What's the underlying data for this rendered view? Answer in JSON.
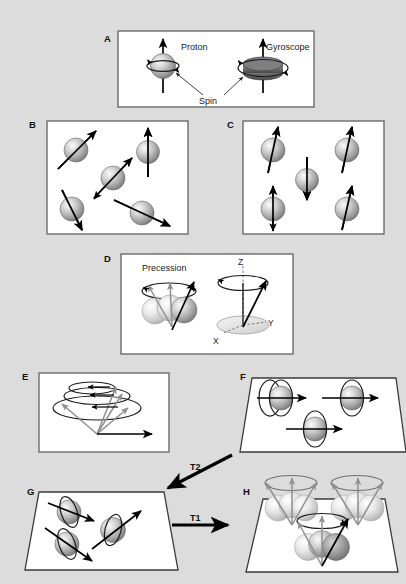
{
  "figure": {
    "background_color": "#dcdcdc",
    "panel_fill": "#ffffff",
    "panel_stroke": "#6b6b6b",
    "width": 406,
    "height": 584
  },
  "panels": [
    {
      "id": "A",
      "label": "A",
      "caption": "Proton spin compared to a spinning gyroscope",
      "texts": {
        "proton": "Proton",
        "gyroscope": "Gyroscope",
        "spin": "Spin"
      }
    },
    {
      "id": "B",
      "label": "B",
      "caption": "Randomly oriented proton spins with no external magnetic field",
      "spin_count": 5,
      "spin_angles_deg": [
        -50,
        -90,
        -40,
        -115,
        -25
      ]
    },
    {
      "id": "C",
      "label": "C",
      "caption": "Spins aligned parallel and antiparallel in an external magnetic field",
      "spin_count": 5,
      "spin_directions": [
        "up",
        "up",
        "down",
        "up",
        "up"
      ]
    },
    {
      "id": "D",
      "label": "D",
      "caption": "Precession of the magnetic moment about the main field axis",
      "texts": {
        "precession": "Precession",
        "axis_z": "Z",
        "axis_y": "Y",
        "axis_x": "X"
      }
    },
    {
      "id": "E",
      "label": "E",
      "caption": "Net magnetization vector spiralling down into the transverse plane"
    },
    {
      "id": "F",
      "label": "F",
      "caption": "Spins precessing in phase within the transverse plane"
    },
    {
      "id": "G",
      "label": "G",
      "caption": "Spins dephasing in the transverse plane"
    },
    {
      "id": "H",
      "label": "H",
      "caption": "Longitudinal recovery of magnetization along the main field"
    }
  ],
  "relaxation_arrows": [
    {
      "id": "T2",
      "label": "T2",
      "from_panel": "F",
      "to_panel": "G",
      "direction": "diagonal-down-left"
    },
    {
      "id": "T1",
      "label": "T1",
      "from_panel": "G",
      "to_panel": "H",
      "direction": "horizontal-right"
    }
  ],
  "colors": {
    "arrow_black": "#000000",
    "arrow_gray": "#8f8f8f",
    "sphere_light": "#f2f2f2",
    "sphere_mid": "#b8b8b8",
    "sphere_dark": "#7d7d7d",
    "plane_stroke": "#3a3a3a"
  }
}
